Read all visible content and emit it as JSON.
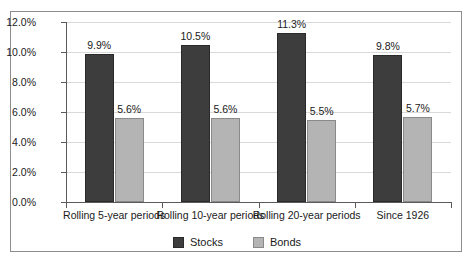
{
  "chart_data": {
    "type": "bar",
    "title": "",
    "xlabel": "",
    "ylabel": "",
    "categories": [
      "Rolling 5-year periods",
      "Rolling 10-year periods",
      "Rolling 20-year periods",
      "Since 1926"
    ],
    "series": [
      {
        "name": "Stocks",
        "values": [
          9.9,
          10.5,
          11.3,
          9.8
        ],
        "color": "#3d3d3d"
      },
      {
        "name": "Bonds",
        "values": [
          5.6,
          5.6,
          5.5,
          5.7
        ],
        "color": "#b4b4b4"
      }
    ],
    "data_labels": [
      [
        "9.9%",
        "5.6%"
      ],
      [
        "10.5%",
        "5.6%"
      ],
      [
        "11.3%",
        "5.5%"
      ],
      [
        "9.8%",
        "5.7%"
      ]
    ],
    "ylim": [
      0,
      12
    ],
    "ytick_values": [
      0,
      2,
      4,
      6,
      8,
      10,
      12
    ],
    "ytick_labels": [
      "0.0%",
      "2.0%",
      "4.0%",
      "6.0%",
      "8.0%",
      "10.0%",
      "12.0%"
    ],
    "grid": true,
    "legend_position": "bottom",
    "legend": [
      "Stocks",
      "Bonds"
    ],
    "colors": {
      "stocks": "#3d3d3d",
      "bonds": "#b4b4b4",
      "gridline": "#d9d9d9",
      "axis": "#5a5a5a",
      "frame": "#8d8d8d",
      "background": "#ffffff",
      "text": "#1a1a1a"
    }
  }
}
